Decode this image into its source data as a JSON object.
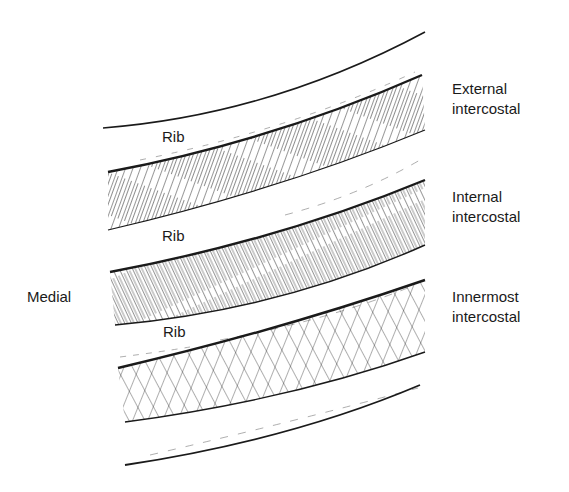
{
  "diagram": {
    "type": "anatomical-illustration",
    "labels": {
      "external": {
        "line1": "External",
        "line2": "intercostal"
      },
      "internal": {
        "line1": "Internal",
        "line2": "intercostal"
      },
      "innermost": {
        "line1": "Innermost",
        "line2": "intercostal"
      },
      "medial": "Medial",
      "rib_top": "Rib",
      "rib_middle": "Rib",
      "rib_bottom": "Rib"
    },
    "colors": {
      "ink": "#1a1a1a",
      "background": "#ffffff"
    }
  }
}
